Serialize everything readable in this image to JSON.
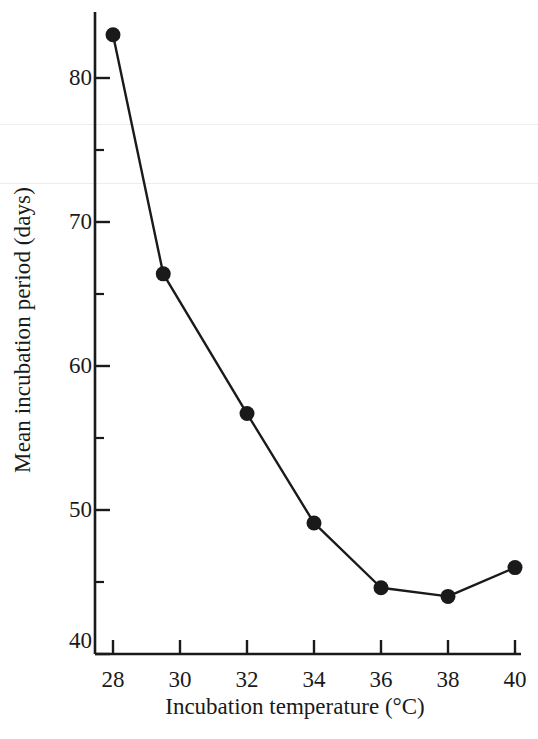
{
  "chart_data": {
    "type": "line",
    "title": "",
    "xlabel": "Incubation temperature (°C)",
    "ylabel": "Mean incubation period (days)",
    "xlim": [
      28,
      40
    ],
    "ylim": [
      40,
      83.8
    ],
    "grid": false,
    "legend": "none",
    "marker": "filled-circle",
    "line_color": "#1a1a1a",
    "marker_color": "#1a1a1a",
    "x": [
      28.0,
      29.5,
      32.0,
      34.0,
      36.0,
      38.0,
      40.0
    ],
    "values": [
      83.0,
      66.4,
      56.7,
      49.1,
      44.6,
      44.0,
      46.0
    ],
    "points": [
      {
        "x": 28.0,
        "y": 83.0
      },
      {
        "x": 29.5,
        "y": 66.4
      },
      {
        "x": 32.0,
        "y": 56.7
      },
      {
        "x": 34.0,
        "y": 49.1
      },
      {
        "x": 36.0,
        "y": 44.6
      },
      {
        "x": 38.0,
        "y": 44.0
      },
      {
        "x": 40.0,
        "y": 46.0
      }
    ],
    "x_ticks": [
      28,
      30,
      32,
      34,
      36,
      38,
      40
    ],
    "x_tick_labels": [
      "28",
      "30",
      "32",
      "34",
      "36",
      "38",
      "40"
    ],
    "y_ticks_major": [
      40,
      50,
      60,
      70,
      80
    ],
    "y_tick_labels": [
      "40",
      "50",
      "60",
      "70",
      "80"
    ],
    "y_ticks_minor": [
      45,
      55,
      65,
      75
    ]
  }
}
